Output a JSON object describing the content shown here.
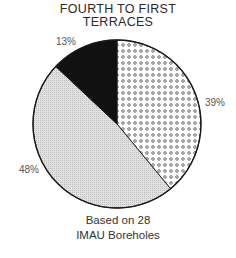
{
  "chart_data": {
    "type": "pie",
    "title": "FOURTH TO FIRST TERRACES",
    "title_lines": [
      "FOURTH TO FIRST",
      "TERRACES"
    ],
    "categories": [
      "Dotted",
      "Gray (fine stipple)",
      "Black"
    ],
    "values": [
      39,
      48,
      13
    ],
    "labels": [
      "39%",
      "48%",
      "13%"
    ],
    "fills": [
      "dotted pattern",
      "light gray stipple",
      "#111111"
    ],
    "start_angle": "12 o'clock, clockwise",
    "annotation": "Based on 28 IMAU Boreholes",
    "annotation_lines": [
      "Based on 28",
      "IMAU Boreholes"
    ]
  }
}
